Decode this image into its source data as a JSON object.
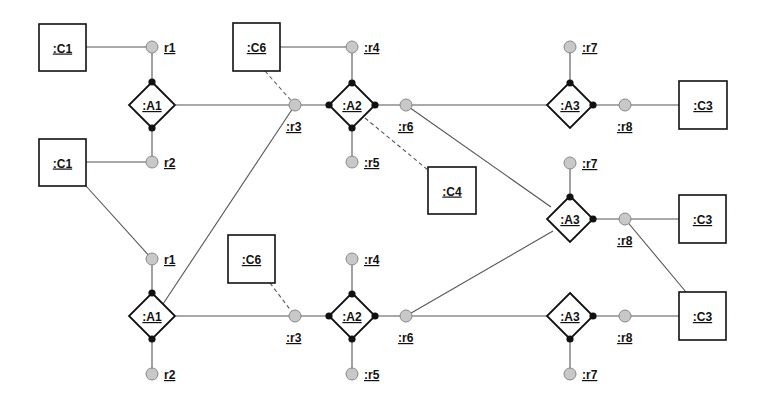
{
  "diagram": {
    "type": "collaboration-role-diagram",
    "classes": [
      {
        "id": "c1a",
        "label": ":C1",
        "x": 39,
        "y": 24,
        "w": 47,
        "h": 47
      },
      {
        "id": "c1b",
        "label": ":C1",
        "x": 39,
        "y": 139,
        "w": 47,
        "h": 47
      },
      {
        "id": "c6a",
        "label": ":C6",
        "x": 233,
        "y": 23,
        "w": 47,
        "h": 48
      },
      {
        "id": "c6b",
        "label": ":C6",
        "x": 228,
        "y": 235,
        "w": 47,
        "h": 48
      },
      {
        "id": "c4",
        "label": ":C4",
        "x": 428,
        "y": 167,
        "w": 48,
        "h": 47
      },
      {
        "id": "c3a",
        "label": ":C3",
        "x": 679,
        "y": 81,
        "w": 48,
        "h": 48
      },
      {
        "id": "c3b",
        "label": ":C3",
        "x": 679,
        "y": 195,
        "w": 47,
        "h": 48
      },
      {
        "id": "c3c",
        "label": ":C3",
        "x": 679,
        "y": 292,
        "w": 47,
        "h": 48
      }
    ],
    "associations": [
      {
        "id": "a1a",
        "label": ":A1",
        "cx": 152,
        "cy": 105
      },
      {
        "id": "a2a",
        "label": ":A2",
        "cx": 352,
        "cy": 105
      },
      {
        "id": "a3a",
        "label": ":A3",
        "cx": 570,
        "cy": 105
      },
      {
        "id": "a3b",
        "label": ":A3",
        "cx": 570,
        "cy": 219
      },
      {
        "id": "a1b",
        "label": ":A1",
        "cx": 152,
        "cy": 316
      },
      {
        "id": "a2b",
        "label": ":A2",
        "cx": 352,
        "cy": 316
      },
      {
        "id": "a3c",
        "label": ":A3",
        "cx": 570,
        "cy": 316
      }
    ],
    "roles": [
      {
        "id": "r1a",
        "label": "r1",
        "cx": 152,
        "cy": 47,
        "lx": 164,
        "ly": 52
      },
      {
        "id": "r2a",
        "label": "r2",
        "cx": 152,
        "cy": 162,
        "lx": 164,
        "ly": 167
      },
      {
        "id": "r3a",
        "label": ":r3",
        "cx": 295,
        "cy": 105,
        "lx": 286,
        "ly": 131
      },
      {
        "id": "r4a",
        "label": ":r4",
        "cx": 352,
        "cy": 47,
        "lx": 364,
        "ly": 52
      },
      {
        "id": "r5a",
        "label": ":r5",
        "cx": 352,
        "cy": 162,
        "lx": 364,
        "ly": 167
      },
      {
        "id": "r6a",
        "label": ":r6",
        "cx": 406,
        "cy": 105,
        "lx": 398,
        "ly": 131
      },
      {
        "id": "r7a",
        "label": ":r7",
        "cx": 570,
        "cy": 47,
        "lx": 582,
        "ly": 52
      },
      {
        "id": "r8a",
        "label": ":r8",
        "cx": 625,
        "cy": 105,
        "lx": 617,
        "ly": 131
      },
      {
        "id": "r7b",
        "label": ":r7",
        "cx": 570,
        "cy": 163,
        "lx": 582,
        "ly": 168
      },
      {
        "id": "r8b",
        "label": ":r8",
        "cx": 625,
        "cy": 219,
        "lx": 617,
        "ly": 245
      },
      {
        "id": "r1b",
        "label": "r1",
        "cx": 152,
        "cy": 259,
        "lx": 164,
        "ly": 264
      },
      {
        "id": "r2b",
        "label": "r2",
        "cx": 152,
        "cy": 374,
        "lx": 164,
        "ly": 379
      },
      {
        "id": "r3b",
        "label": ":r3",
        "cx": 295,
        "cy": 316,
        "lx": 286,
        "ly": 342
      },
      {
        "id": "r4b",
        "label": ":r4",
        "cx": 352,
        "cy": 259,
        "lx": 364,
        "ly": 264
      },
      {
        "id": "r5b",
        "label": ":r5",
        "cx": 352,
        "cy": 374,
        "lx": 364,
        "ly": 379
      },
      {
        "id": "r6b",
        "label": ":r6",
        "cx": 406,
        "cy": 316,
        "lx": 398,
        "ly": 342
      },
      {
        "id": "r8c",
        "label": ":r8",
        "cx": 625,
        "cy": 316,
        "lx": 617,
        "ly": 342
      },
      {
        "id": "r7c",
        "label": ":r7",
        "cx": 570,
        "cy": 374,
        "lx": 582,
        "ly": 379
      }
    ],
    "lines": [
      {
        "x1": 86,
        "y1": 47,
        "x2": 152,
        "y2": 47,
        "style": "solid"
      },
      {
        "x1": 152,
        "y1": 47,
        "x2": 152,
        "y2": 162,
        "style": "solid"
      },
      {
        "x1": 86,
        "y1": 162,
        "x2": 152,
        "y2": 162,
        "style": "solid"
      },
      {
        "x1": 176,
        "y1": 105,
        "x2": 328,
        "y2": 105,
        "style": "solid"
      },
      {
        "x1": 280,
        "y1": 47,
        "x2": 352,
        "y2": 47,
        "style": "solid"
      },
      {
        "x1": 352,
        "y1": 47,
        "x2": 352,
        "y2": 162,
        "style": "solid"
      },
      {
        "x1": 376,
        "y1": 105,
        "x2": 547,
        "y2": 105,
        "style": "solid"
      },
      {
        "x1": 570,
        "y1": 47,
        "x2": 570,
        "y2": 83,
        "style": "solid"
      },
      {
        "x1": 594,
        "y1": 105,
        "x2": 679,
        "y2": 105,
        "style": "solid"
      },
      {
        "x1": 406,
        "y1": 105,
        "x2": 551,
        "y2": 207,
        "style": "solid"
      },
      {
        "x1": 570,
        "y1": 163,
        "x2": 570,
        "y2": 197,
        "style": "solid"
      },
      {
        "x1": 594,
        "y1": 219,
        "x2": 679,
        "y2": 219,
        "style": "solid"
      },
      {
        "x1": 625,
        "y1": 219,
        "x2": 686,
        "y2": 292,
        "style": "solid"
      },
      {
        "x1": 86,
        "y1": 186,
        "x2": 152,
        "y2": 259,
        "style": "solid"
      },
      {
        "x1": 152,
        "y1": 259,
        "x2": 152,
        "y2": 374,
        "style": "solid"
      },
      {
        "x1": 163,
        "y1": 304,
        "x2": 295,
        "y2": 105,
        "style": "solid"
      },
      {
        "x1": 176,
        "y1": 316,
        "x2": 328,
        "y2": 316,
        "style": "solid"
      },
      {
        "x1": 352,
        "y1": 259,
        "x2": 352,
        "y2": 374,
        "style": "solid"
      },
      {
        "x1": 376,
        "y1": 316,
        "x2": 547,
        "y2": 316,
        "style": "solid"
      },
      {
        "x1": 406,
        "y1": 316,
        "x2": 553,
        "y2": 231,
        "style": "solid"
      },
      {
        "x1": 594,
        "y1": 316,
        "x2": 679,
        "y2": 316,
        "style": "solid"
      },
      {
        "x1": 570,
        "y1": 338,
        "x2": 570,
        "y2": 374,
        "style": "solid"
      },
      {
        "x1": 265,
        "y1": 71,
        "x2": 295,
        "y2": 105,
        "style": "dashed"
      },
      {
        "x1": 365,
        "y1": 118,
        "x2": 428,
        "y2": 170,
        "style": "dashed"
      },
      {
        "x1": 270,
        "y1": 283,
        "x2": 295,
        "y2": 316,
        "style": "dashed"
      }
    ],
    "dots": [
      {
        "x": 152,
        "y": 82
      },
      {
        "x": 152,
        "y": 128
      },
      {
        "x": 352,
        "y": 83
      },
      {
        "x": 352,
        "y": 128
      },
      {
        "x": 329,
        "y": 105
      },
      {
        "x": 375,
        "y": 105
      },
      {
        "x": 570,
        "y": 83
      },
      {
        "x": 593,
        "y": 105
      },
      {
        "x": 570,
        "y": 197
      },
      {
        "x": 593,
        "y": 219
      },
      {
        "x": 152,
        "y": 293
      },
      {
        "x": 152,
        "y": 339
      },
      {
        "x": 352,
        "y": 294
      },
      {
        "x": 352,
        "y": 339
      },
      {
        "x": 329,
        "y": 316
      },
      {
        "x": 375,
        "y": 316
      },
      {
        "x": 593,
        "y": 316
      },
      {
        "x": 570,
        "y": 339
      }
    ]
  }
}
